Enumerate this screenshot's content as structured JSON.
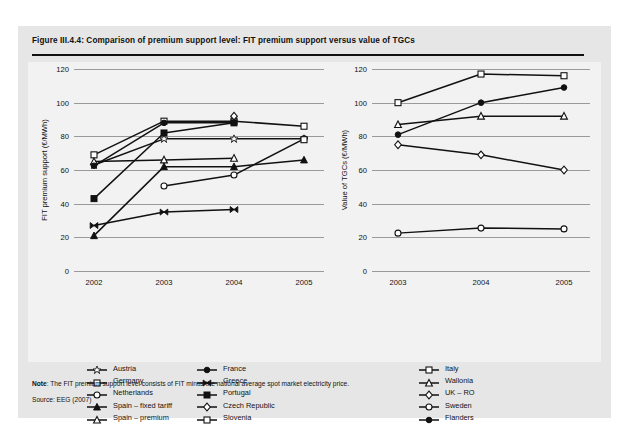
{
  "figure": {
    "title": "Figure III.4.4: Comparison of premium support level: FIT premium support versus value of TGCs",
    "note_label": "Note",
    "note_text": ": The FIT premium support level consists of FIT minus the national average spot market electricity price.",
    "source": "Source: EEG (2007)"
  },
  "colors": {
    "panel": "#e6e6e6",
    "plot": "#f2f2f2",
    "ink": "#111111",
    "grid": "#9a9a9a"
  },
  "chart_data": [
    {
      "type": "line",
      "title": "FIT premium support",
      "xlabel": "",
      "ylabel": "FIT premium support (€/MWh)",
      "categories": [
        "2002",
        "2003",
        "2004",
        "2005"
      ],
      "ylim": [
        0,
        120
      ],
      "yticks": [
        0,
        20,
        40,
        60,
        80,
        100,
        120
      ],
      "grid": true,
      "legend_position": "bottom-left",
      "series": [
        {
          "name": "Austria",
          "marker": "star-open",
          "x": [
            "2002",
            "2003",
            "2004",
            "2005"
          ],
          "values": [
            63,
            78.5,
            78.5,
            78.5
          ]
        },
        {
          "name": "Germany",
          "marker": "square-open",
          "x": [
            "2002",
            "2003",
            "2004",
            "2005"
          ],
          "values": [
            69,
            89,
            89,
            86
          ]
        },
        {
          "name": "Netherlands",
          "marker": "circle-open",
          "x": [
            "2003",
            "2004",
            "2005"
          ],
          "values": [
            50.5,
            57,
            78.5
          ]
        },
        {
          "name": "Spain – fixed tariff",
          "marker": "triangle-fill",
          "x": [
            "2002",
            "2003",
            "2004",
            "2005"
          ],
          "values": [
            21,
            62,
            62,
            66
          ]
        },
        {
          "name": "Spain – premium",
          "marker": "triangle-open",
          "x": [
            "2002",
            "2003",
            "2004"
          ],
          "values": [
            65,
            66,
            67
          ]
        },
        {
          "name": "France",
          "marker": "circle-fill",
          "x": [
            "2002",
            "2003",
            "2004"
          ],
          "values": [
            62.5,
            88,
            88
          ]
        },
        {
          "name": "Greece",
          "marker": "bowtie",
          "x": [
            "2002",
            "2003",
            "2004"
          ],
          "values": [
            27,
            35,
            36.5
          ]
        },
        {
          "name": "Portugal",
          "marker": "square-fill",
          "x": [
            "2002",
            "2003",
            "2004"
          ],
          "values": [
            43,
            82,
            88
          ]
        },
        {
          "name": "Czech Republic",
          "marker": "diamond-open",
          "x": [
            "2004"
          ],
          "values": [
            92
          ]
        },
        {
          "name": "Slovenia",
          "marker": "square-open",
          "x": [
            "2005"
          ],
          "values": [
            78
          ]
        }
      ]
    },
    {
      "type": "line",
      "title": "Value of TGCs",
      "xlabel": "",
      "ylabel": "Value of TGCs (€/MWh)",
      "categories": [
        "2003",
        "2004",
        "2005"
      ],
      "ylim": [
        0,
        120
      ],
      "yticks": [
        0,
        20,
        40,
        60,
        80,
        100,
        120
      ],
      "grid": true,
      "legend_position": "bottom-right",
      "series": [
        {
          "name": "Italy",
          "marker": "square-open",
          "x": [
            "2003",
            "2004",
            "2005"
          ],
          "values": [
            100,
            117,
            116
          ]
        },
        {
          "name": "Wallonia",
          "marker": "triangle-open",
          "x": [
            "2003",
            "2004",
            "2005"
          ],
          "values": [
            87,
            92,
            92
          ]
        },
        {
          "name": "UK – RO",
          "marker": "diamond-open",
          "x": [
            "2003",
            "2004",
            "2005"
          ],
          "values": [
            75,
            69,
            60
          ]
        },
        {
          "name": "Sweden",
          "marker": "circle-open",
          "x": [
            "2003",
            "2004",
            "2005"
          ],
          "values": [
            22.5,
            25.5,
            25
          ]
        },
        {
          "name": "Flanders",
          "marker": "circle-fill",
          "x": [
            "2003",
            "2004",
            "2005"
          ],
          "values": [
            81,
            100,
            109
          ]
        }
      ]
    }
  ],
  "legend_columns": [
    {
      "id": "col-1",
      "items": [
        {
          "label": "Austria",
          "marker": "star-open"
        },
        {
          "label": "Germany",
          "marker": "square-open"
        },
        {
          "label": "Netherlands",
          "marker": "circle-open"
        },
        {
          "label": "Spain – fixed tariff",
          "marker": "triangle-fill"
        },
        {
          "label": "Spain – premium",
          "marker": "triangle-open"
        }
      ]
    },
    {
      "id": "col-2",
      "items": [
        {
          "label": "France",
          "marker": "circle-fill"
        },
        {
          "label": "Greece",
          "marker": "bowtie"
        },
        {
          "label": "Portugal",
          "marker": "square-fill"
        },
        {
          "label": "Czech Republic",
          "marker": "diamond-open"
        },
        {
          "label": "Slovenia",
          "marker": "square-open"
        }
      ]
    },
    {
      "id": "col-3",
      "items": [
        {
          "label": "Italy",
          "marker": "square-open"
        },
        {
          "label": "Wallonia",
          "marker": "triangle-open"
        },
        {
          "label": "UK – RO",
          "marker": "diamond-open"
        },
        {
          "label": "Sweden",
          "marker": "circle-open"
        },
        {
          "label": "Flanders",
          "marker": "circle-fill"
        }
      ]
    }
  ]
}
